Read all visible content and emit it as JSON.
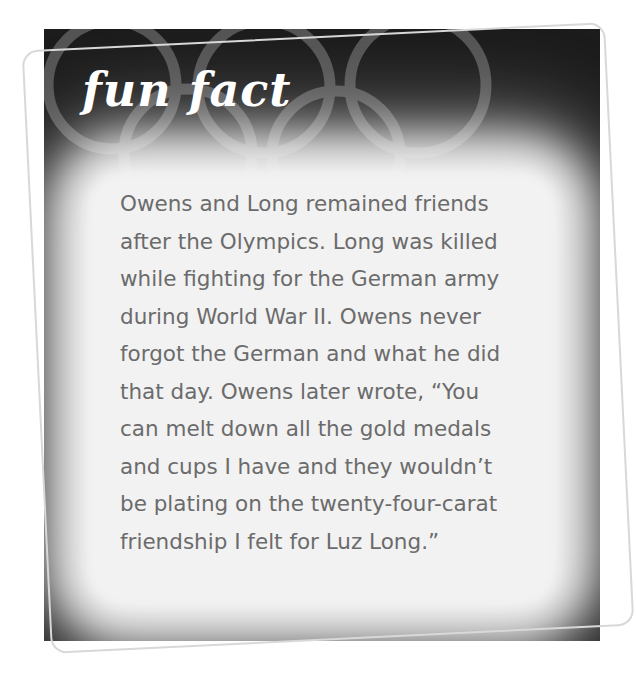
{
  "card": {
    "title": "fun fact",
    "background_color": "#1c1c1c",
    "glow_color": "#f2f2f2",
    "title_color": "#ffffff",
    "text_color": "#6b6b6b",
    "decoration": "olympic-rings-icon",
    "body_lines": [
      "Owens and Long remained friends",
      "after the Olympics. Long was killed",
      "while fighting for the German army",
      "during World War II. Owens never",
      "forgot the German and what he did",
      "that day. Owens later wrote, “You",
      "can melt down all the gold medals",
      "and cups I have and they wouldn’t",
      "be plating on the twenty-four-carat",
      "friendship I felt for Luz Long.”"
    ]
  }
}
